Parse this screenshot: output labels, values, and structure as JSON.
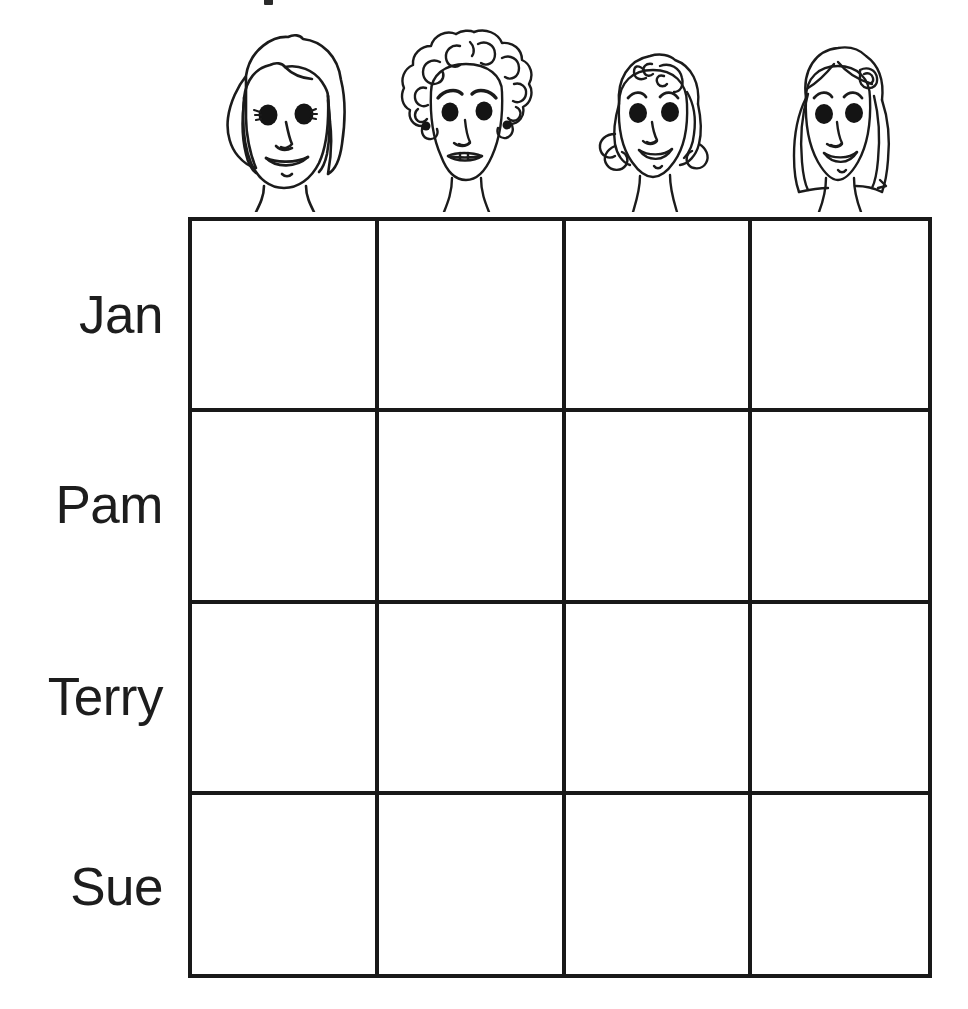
{
  "worksheet": {
    "title": "Logic grid worksheet",
    "line_color": "#191919",
    "text_color": "#1d1d1d",
    "background": "#ffffff",
    "top_crop_mark": "partial-cut-off-text-mark"
  },
  "columns": [
    {
      "id": "col-1",
      "header_icon": "face-straight-bob-hair-icon",
      "label": ""
    },
    {
      "id": "col-2",
      "header_icon": "face-curly-hair-earrings-icon",
      "label": ""
    },
    {
      "id": "col-3",
      "header_icon": "face-wavy-hair-icon",
      "label": ""
    },
    {
      "id": "col-4",
      "header_icon": "face-long-hair-bow-icon",
      "label": ""
    }
  ],
  "rows": [
    {
      "id": "row-jan",
      "label": "Jan"
    },
    {
      "id": "row-pam",
      "label": "Pam"
    },
    {
      "id": "row-terry",
      "label": "Terry"
    },
    {
      "id": "row-sue",
      "label": "Sue"
    }
  ],
  "cells": [
    [
      "",
      "",
      "",
      ""
    ],
    [
      "",
      "",
      "",
      ""
    ],
    [
      "",
      "",
      "",
      ""
    ],
    [
      "",
      "",
      "",
      ""
    ]
  ],
  "geometry": {
    "grid_left": 188,
    "grid_top": 217,
    "grid_right": 932,
    "grid_bottom": 978,
    "column_x": [
      188,
      375,
      562,
      748,
      932
    ],
    "row_y": [
      217,
      408,
      600,
      791,
      978
    ]
  }
}
